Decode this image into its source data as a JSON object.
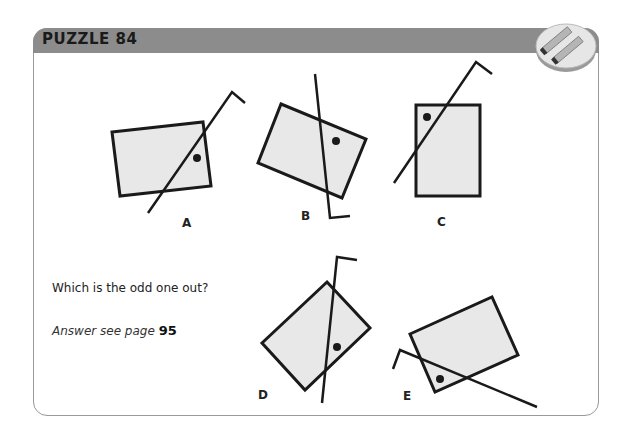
{
  "header": {
    "title": "PUZZLE 84",
    "icon": "matchsticks-icon",
    "color": "#8c8c8c"
  },
  "question": "Which is the odd one out?",
  "answer": {
    "hint": "Answer see page",
    "page": "95"
  },
  "figures": [
    {
      "label": "A"
    },
    {
      "label": "B"
    },
    {
      "label": "C"
    },
    {
      "label": "D"
    },
    {
      "label": "E"
    }
  ],
  "colors": {
    "shape_fill": "#e8e8e8",
    "stroke": "#1a1a1a"
  }
}
